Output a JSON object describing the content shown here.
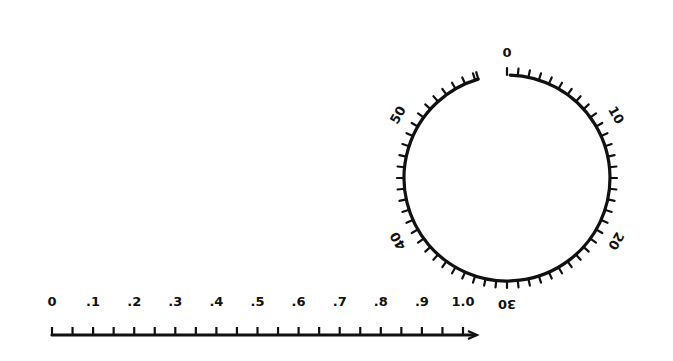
{
  "diagram": {
    "ink_color": "#111111",
    "background": "#ffffff",
    "dial": {
      "shape": "circle",
      "center": [
        507,
        178
      ],
      "radius": 103,
      "gap_at_top": true,
      "range": [
        0,
        60
      ],
      "tick_count": 60,
      "labels": [
        {
          "text": "0",
          "value": 0
        },
        {
          "text": "10",
          "value": 10
        },
        {
          "text": "20",
          "value": 20
        },
        {
          "text": "30",
          "value": 30
        },
        {
          "text": "40",
          "value": 40
        },
        {
          "text": "50",
          "value": 50
        }
      ]
    },
    "number_line": {
      "start": [
        52,
        335
      ],
      "end": [
        475,
        335
      ],
      "range": [
        0,
        1.0
      ],
      "has_arrow": true,
      "minor_tick_step": 0.05,
      "labels": [
        {
          "text": "0",
          "value": 0.0
        },
        {
          "text": ".1",
          "value": 0.1
        },
        {
          "text": ".2",
          "value": 0.2
        },
        {
          "text": ".3",
          "value": 0.3
        },
        {
          "text": ".4",
          "value": 0.4
        },
        {
          "text": ".5",
          "value": 0.5
        },
        {
          "text": ".6",
          "value": 0.6
        },
        {
          "text": ".7",
          "value": 0.7
        },
        {
          "text": ".8",
          "value": 0.8
        },
        {
          "text": ".9",
          "value": 0.9
        },
        {
          "text": "1.0",
          "value": 1.0
        }
      ]
    }
  }
}
